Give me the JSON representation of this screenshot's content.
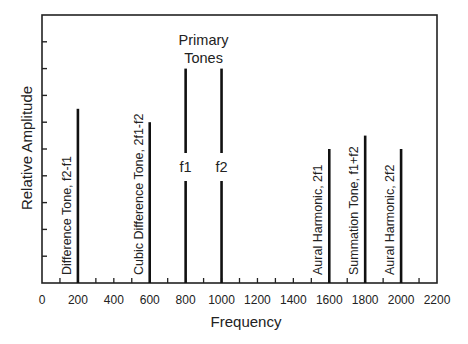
{
  "chart_data": {
    "type": "bar",
    "title": "",
    "xlabel": "Frequency",
    "ylabel": "Relative Amplitude",
    "xlim": [
      0,
      2200
    ],
    "ylim": [
      0,
      10
    ],
    "x_ticks": [
      0,
      200,
      400,
      600,
      800,
      1000,
      1200,
      1400,
      1600,
      1800,
      2000,
      2200
    ],
    "x_minor_tick_step": 100,
    "y_tick_count": 10,
    "y_tick_labels_shown": false,
    "grid": false,
    "legend": null,
    "series": [
      {
        "name": "Difference Tone, f2-f1",
        "x": 200,
        "value": 6.5,
        "label": "Difference Tone, f2-f1",
        "label_position": "left-rotated"
      },
      {
        "name": "Cubic Difference Tone, 2f1-f2",
        "x": 600,
        "value": 6.0,
        "label": "Cubic Difference Tone, 2f1-f2",
        "label_position": "left-rotated"
      },
      {
        "name": "f1",
        "x": 800,
        "value": 8.0,
        "label": "f1",
        "label_position": "inline"
      },
      {
        "name": "f2",
        "x": 1000,
        "value": 8.0,
        "label": "f2",
        "label_position": "inline"
      },
      {
        "name": "Aural Harmonic, 2f1",
        "x": 1600,
        "value": 5.0,
        "label": "Aural Harmonic, 2f1",
        "label_position": "left-rotated"
      },
      {
        "name": "Summation Tone, f1+f2",
        "x": 1800,
        "value": 5.5,
        "label": "Summation Tone, f1+f2",
        "label_position": "left-rotated"
      },
      {
        "name": "Aural Harmonic, 2f2",
        "x": 2000,
        "value": 5.0,
        "label": "Aural Harmonic, 2f2",
        "label_position": "left-rotated"
      }
    ],
    "annotations": [
      {
        "text": "Primary",
        "x": 900,
        "y_px": 40
      },
      {
        "text": "Tones",
        "x": 900,
        "y_px": 58
      }
    ]
  },
  "colors": {
    "axis": "#222222",
    "bar": "#111111",
    "text": "#222222",
    "background": "#ffffff"
  }
}
